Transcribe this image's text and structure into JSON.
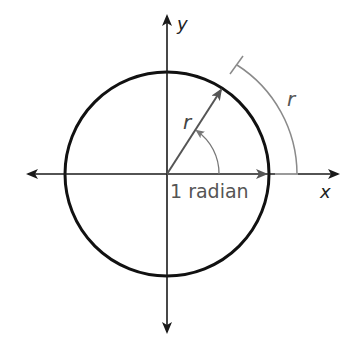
{
  "diagram": {
    "labels": {
      "y_axis": "y",
      "x_axis": "x",
      "radius": "r",
      "arc_length": "r",
      "angle": "1 radian"
    },
    "colors": {
      "circle": "#111111",
      "axes": "#1a1a1a",
      "radius_arrow": "#555555",
      "arc_measure": "#8a8a8a",
      "text": "#444444"
    },
    "geometry": {
      "center": [
        167,
        174
      ],
      "circle_radius": 102,
      "outer_arc_radius": 130,
      "angle_degrees": 57.3
    }
  }
}
